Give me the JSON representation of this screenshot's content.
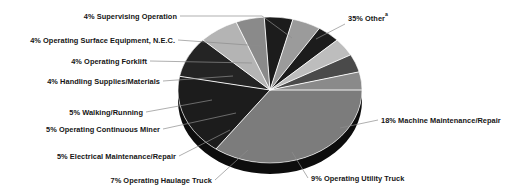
{
  "chart_data": {
    "type": "pie",
    "title": "",
    "subtitle": "",
    "xlabel": "",
    "ylabel": "",
    "legend_position": "callout-labels",
    "grid": false,
    "total": 100,
    "units": "percent",
    "style": "3d-elliptical-grayscale",
    "footnote_marker": "a",
    "categories": [
      "Other",
      "Machine Maintenance/Repair",
      "Operating Utility Truck",
      "Operating Haulage Truck",
      "Electrical Maintenance/Repair",
      "Operating Continuous Miner",
      "Walking/Running",
      "Handling Supplies/Materials",
      "Operating Forklift",
      "Operating Surface Equipment, N.E.C.",
      "Supervising Operation"
    ],
    "values": [
      35,
      18,
      9,
      7,
      5,
      5,
      5,
      4,
      4,
      4,
      4
    ],
    "slices": [
      {
        "label": "35% Other",
        "percent": 35,
        "name": "Other",
        "color": "#7c7c7c",
        "side": "right",
        "has_superscript": true
      },
      {
        "label": "18% Machine Maintenance/Repair",
        "percent": 18,
        "name": "Machine Maintenance/Repair",
        "color": "#1c1c1c",
        "side": "right",
        "has_superscript": false
      },
      {
        "label": "9% Operating Utility Truck",
        "percent": 9,
        "name": "Operating Utility Truck",
        "color": "#242424",
        "side": "right",
        "has_superscript": false
      },
      {
        "label": "7% Operating Haulage Truck",
        "percent": 7,
        "name": "Operating Haulage Truck",
        "color": "#b4b4b4",
        "side": "left",
        "has_superscript": false
      },
      {
        "label": "5% Electrical Maintenance/Repair",
        "percent": 5,
        "name": "Electrical Maintenance/Repair",
        "color": "#8a8a8a",
        "side": "left",
        "has_superscript": false
      },
      {
        "label": "5% Operating Continuous Miner",
        "percent": 5,
        "name": "Operating Continuous Miner",
        "color": "#1c1c1c",
        "side": "left",
        "has_superscript": false
      },
      {
        "label": "5% Walking/Running",
        "percent": 5,
        "name": "Walking/Running",
        "color": "#9b9b9b",
        "side": "left",
        "has_superscript": false
      },
      {
        "label": "4% Handling Supplies/Materials",
        "percent": 4,
        "name": "Handling Supplies/Materials",
        "color": "#1c1c1c",
        "side": "left",
        "has_superscript": false
      },
      {
        "label": "4% Operating Forklift",
        "percent": 4,
        "name": "Operating Forklift",
        "color": "#bdbdbd",
        "side": "left",
        "has_superscript": false
      },
      {
        "label": "4% Operating Surface Equipment, N.E.C.",
        "percent": 4,
        "name": "Operating Surface Equipment, N.E.C.",
        "color": "#4a4a4a",
        "side": "left",
        "has_superscript": false
      },
      {
        "label": "4% Supervising Operation",
        "percent": 4,
        "name": "Supervising Operation",
        "color": "#8a8a8a",
        "side": "left",
        "has_superscript": false
      }
    ],
    "colors": {
      "background": "#ffffff",
      "text": "#151515",
      "leader_line": "#8c8c8c",
      "slice_separator": "#ffffff",
      "depth_shadow": "#0d0d0d"
    }
  },
  "labels": {
    "supervising_operation": "4% Supervising Operation",
    "operating_surface_equipment": "4% Operating Surface Equipment, N.E.C.",
    "operating_forklift": "4% Operating Forklift",
    "handling_supplies": "4% Handling Supplies/Materials",
    "walking_running": "5% Walking/Running",
    "operating_continuous_miner": "5% Operating Continuous Miner",
    "electrical_maintenance": "5% Electrical Maintenance/Repair",
    "operating_haulage_truck": "7% Operating Haulage Truck",
    "operating_utility_truck": "9% Operating Utility Truck",
    "machine_maintenance": "18% Machine Maintenance/Repair",
    "other": "35% Other",
    "other_superscript": "a"
  }
}
